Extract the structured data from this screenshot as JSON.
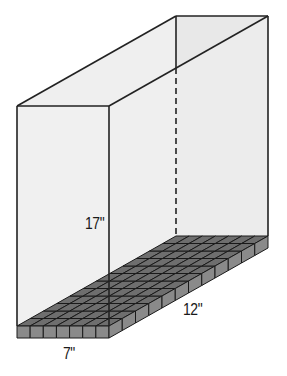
{
  "diagram": {
    "dimensions": {
      "height": "17\"",
      "length": "12\"",
      "width": "7\""
    },
    "base_grid": {
      "columns_front": 7,
      "rows_side": 12
    },
    "colors": {
      "face_fill": "#eeeeee",
      "edge": "#222222",
      "cube_top": "#6e6e6e",
      "cube_side": "#8a8a8a",
      "cube_line": "#1a1a1a"
    }
  }
}
